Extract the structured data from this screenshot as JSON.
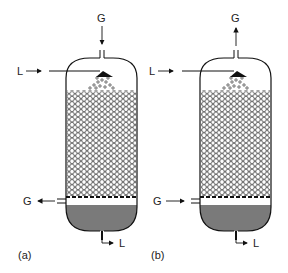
{
  "diagram": {
    "type": "packed-column-schematic",
    "panels": [
      {
        "id": "a",
        "caption": "(a)",
        "gas_in_label": "G",
        "gas_in_direction": "down-into-top",
        "liquid_in_label": "L",
        "gas_out_label": "G",
        "gas_out_direction": "out-left-bottom",
        "liquid_out_label": "L",
        "flow": "co-current"
      },
      {
        "id": "b",
        "caption": "(b)",
        "gas_top_label": "G",
        "gas_top_direction": "up-out-of-top",
        "liquid_in_label": "L",
        "gas_bottom_label": "G",
        "gas_bottom_direction": "in-right-bottom",
        "liquid_out_label": "L",
        "flow": "counter-current"
      }
    ],
    "colors": {
      "outline": "#111111",
      "liquid_pool": "#7a7a7a",
      "packing": "#555555",
      "background": "#ffffff"
    }
  }
}
